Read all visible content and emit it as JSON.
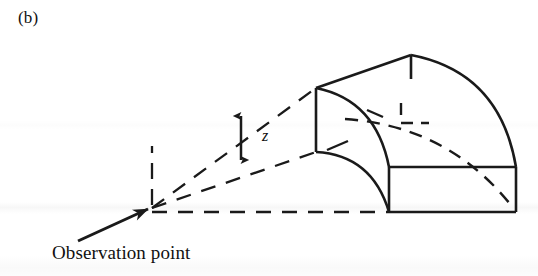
{
  "figure": {
    "panel_label": "(b)",
    "observation_label": "Observation point",
    "height_symbol": "z",
    "ink_color": "#1a1a1a",
    "background_color": "#ffffff"
  },
  "annotations": {
    "dimension_arrow_name": "z",
    "dimension_arrow_style": "double-headed vertical arrow",
    "sight_line_style": "dashed",
    "hidden_edge_style": "dashed"
  },
  "geometry": {
    "solid_description": "quarter-cylinder wedge in perspective",
    "visible_faces": [
      "left face with concave quarter-arc cut",
      "top curved surface",
      "front rectangular face"
    ],
    "apex_tick": true,
    "right_angle_marker": true
  }
}
